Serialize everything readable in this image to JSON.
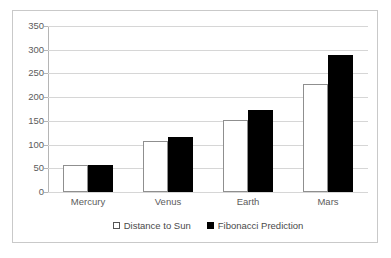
{
  "chart_data": {
    "type": "bar",
    "title": "",
    "subtitle": "",
    "xlabel": "",
    "ylabel": "",
    "categories": [
      "Mercury",
      "Venus",
      "Earth",
      "Mars"
    ],
    "series": [
      {
        "name": "Distance to Sun",
        "color": "#ffffff",
        "values": [
          58,
          108,
          151,
          228
        ]
      },
      {
        "name": "Fibonacci Prediction",
        "color": "#000000",
        "values": [
          58,
          116,
          173,
          289
        ]
      }
    ],
    "ylim": [
      0,
      350
    ],
    "ytick_labels": [
      "0",
      "50",
      "100",
      "150",
      "200",
      "250",
      "300",
      "350"
    ],
    "ytick_values": [
      0,
      50,
      100,
      150,
      200,
      250,
      300,
      350
    ],
    "grid": "horizontal",
    "legend_position": "bottom",
    "annotations": []
  },
  "legend": {
    "entries": [
      {
        "label": "Distance to Sun",
        "marker": "open-square-marker"
      },
      {
        "label": "Fibonacci Prediction",
        "marker": "filled-square-marker"
      }
    ]
  },
  "colors": {
    "series_a": "#ffffff",
    "series_b": "#000000",
    "gridline": "#d6d6d6",
    "axis": "#b5b5b5",
    "frame": "#c9c9c9",
    "text": "#5c5c5c",
    "background": "#ffffff"
  }
}
